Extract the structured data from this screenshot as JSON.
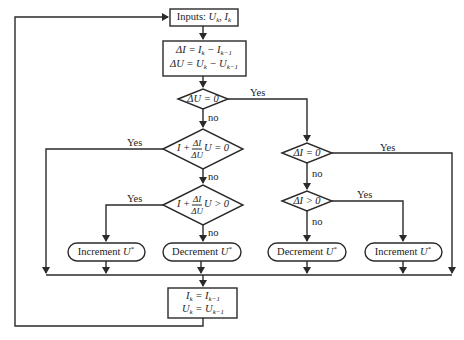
{
  "diagram": {
    "type": "flowchart",
    "nodes": {
      "inputs": {
        "label": "Inputs: U_k, I_k",
        "prefix": "Inputs:",
        "vars": "Uk, Ik"
      },
      "deltas": {
        "line1": "ΔI = I_k − I_{k−1}",
        "line2": "ΔU = U_k − U_{k−1}"
      },
      "cond_du_zero": {
        "label": "ΔU = 0"
      },
      "cond_inc_cond_zero": {
        "label": "I + (ΔI/ΔU)·U = 0",
        "lhs": "I +",
        "num": "ΔI",
        "den": "ΔU",
        "rhs": "U = 0"
      },
      "cond_inc_cond_pos": {
        "label": "I + (ΔI/ΔU)·U > 0",
        "lhs": "I +",
        "num": "ΔI",
        "den": "ΔU",
        "rhs": "U > 0"
      },
      "cond_di_zero": {
        "label": "ΔI = 0"
      },
      "cond_di_pos": {
        "label": "ΔI > 0"
      },
      "action_increment_left": {
        "label": "Increment U*",
        "text": "Increment",
        "var": "U",
        "sup": "*"
      },
      "action_decrement_left": {
        "label": "Decrement U*",
        "text": "Decrement",
        "var": "U",
        "sup": "*"
      },
      "action_decrement_right": {
        "label": "Decrement U*",
        "text": "Decrement",
        "var": "U",
        "sup": "*"
      },
      "action_increment_right": {
        "label": "Increment U*",
        "text": "Increment",
        "var": "U",
        "sup": "*"
      },
      "update": {
        "line1": "I_k = I_{k−1}",
        "line2": "U_k = U_{k−1}"
      }
    },
    "edge_labels": {
      "yes": "Yes",
      "no": "no"
    },
    "edges": [
      {
        "from": "inputs",
        "to": "deltas"
      },
      {
        "from": "deltas",
        "to": "cond_du_zero"
      },
      {
        "from": "cond_du_zero",
        "to": "cond_di_zero",
        "label": "Yes"
      },
      {
        "from": "cond_du_zero",
        "to": "cond_inc_cond_zero",
        "label": "no"
      },
      {
        "from": "cond_inc_cond_zero",
        "to": "update",
        "label": "Yes"
      },
      {
        "from": "cond_inc_cond_zero",
        "to": "cond_inc_cond_pos",
        "label": "no"
      },
      {
        "from": "cond_inc_cond_pos",
        "to": "action_increment_left",
        "label": "Yes"
      },
      {
        "from": "cond_inc_cond_pos",
        "to": "action_decrement_left",
        "label": "no"
      },
      {
        "from": "cond_di_zero",
        "to": "update",
        "label": "Yes"
      },
      {
        "from": "cond_di_zero",
        "to": "cond_di_pos",
        "label": "no"
      },
      {
        "from": "cond_di_pos",
        "to": "action_increment_right",
        "label": "Yes"
      },
      {
        "from": "cond_di_pos",
        "to": "action_decrement_right",
        "label": "no"
      },
      {
        "from": "action_increment_left",
        "to": "update"
      },
      {
        "from": "action_decrement_left",
        "to": "update"
      },
      {
        "from": "action_decrement_right",
        "to": "update"
      },
      {
        "from": "action_increment_right",
        "to": "update"
      },
      {
        "from": "update",
        "to": "inputs"
      }
    ]
  }
}
